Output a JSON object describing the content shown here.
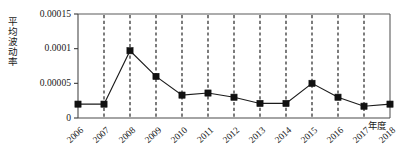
{
  "chart_data": {
    "type": "line",
    "title": "",
    "xlabel": "年度",
    "ylabel": "平均波动率",
    "categories": [
      "2006",
      "2007",
      "2008",
      "2009",
      "2010",
      "2011",
      "2012",
      "2013",
      "2014",
      "2015",
      "2016",
      "2017",
      "2018"
    ],
    "values": [
      2e-05,
      2e-05,
      9.7e-05,
      6e-05,
      3.3e-05,
      3.6e-05,
      3e-05,
      2.1e-05,
      2.1e-05,
      5e-05,
      3e-05,
      1.7e-05,
      2e-05
    ],
    "series": [
      {
        "name": "平均波动率",
        "values": [
          2e-05,
          2e-05,
          9.7e-05,
          6e-05,
          3.3e-05,
          3.6e-05,
          3e-05,
          2.1e-05,
          2.1e-05,
          5e-05,
          3e-05,
          1.7e-05,
          2e-05
        ]
      }
    ],
    "ylim": [
      0,
      0.00015
    ],
    "ytick_labels": [
      "0",
      "0.00005",
      "0.0001",
      "0.00015"
    ],
    "ytick_values": [
      0,
      5e-05,
      0.0001,
      0.00015
    ],
    "grid": "vertical-dashed",
    "legend": "none",
    "marker": "filled-square",
    "line_color": "#111111",
    "marker_color": "#111111",
    "grid_color": "#111111",
    "axis_color": "#4a4a4a"
  },
  "ylabel_chars": [
    "平",
    "均",
    "波",
    "动",
    "率"
  ]
}
